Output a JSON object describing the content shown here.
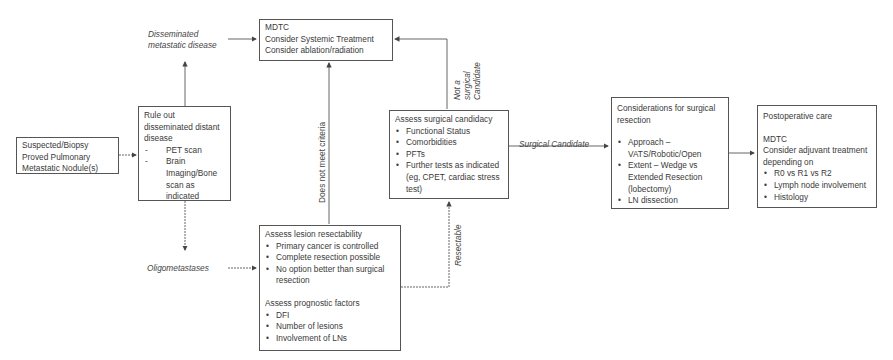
{
  "nodes": {
    "start": {
      "text": "Suspected/Biopsy Proved Pulmonary Metastatic Nodule(s)"
    },
    "rule_out": {
      "title": "Rule out disseminated distant disease",
      "items": [
        "PET scan",
        "Brain Imaging/Bone scan as indicated"
      ]
    },
    "mdtc": {
      "lines": [
        "MDTC",
        "Consider Systemic Treatment",
        "Consider ablation/radiation"
      ]
    },
    "surgical_candidacy": {
      "title": "Assess surgical candidacy",
      "items": [
        "Functional Status",
        "Comorbidities",
        "PFTs",
        "Further tests as indicated (eg, CPET, cardiac stress test)"
      ]
    },
    "resectability": {
      "title": "Assess lesion resectability",
      "items": [
        "Primary cancer is controlled",
        "Complete resection possible",
        "No option better than surgical resection"
      ],
      "prognostic_title": "Assess prognostic factors",
      "prognostic_items": [
        "DFI",
        "Number of lesions",
        "Involvement of LNs"
      ]
    },
    "considerations": {
      "title": "Considerations for surgical resection",
      "items": [
        "Approach – VATS/Robotic/Open",
        "Extent – Wedge vs Extended Resection (lobectomy)",
        "LN dissection"
      ]
    },
    "postop": {
      "title": "Postoperative care",
      "mdtc": "MDTC",
      "subtitle": "Consider adjuvant treatment depending on",
      "items": [
        "R0 vs  R1 vs  R2",
        "Lymph node involvement",
        "Histology"
      ]
    }
  },
  "edge_labels": {
    "disseminated": "Disseminated metastatic disease",
    "oligometastases": "Oligometastases",
    "does_not_meet": "Does not meet criteria",
    "not_surgical": "Not a surgical Candidate",
    "resectable": "Resectable",
    "surgical_candidate": "Surgical Candidate"
  },
  "colors": {
    "line": "#555555",
    "text": "#3a3a3a"
  }
}
